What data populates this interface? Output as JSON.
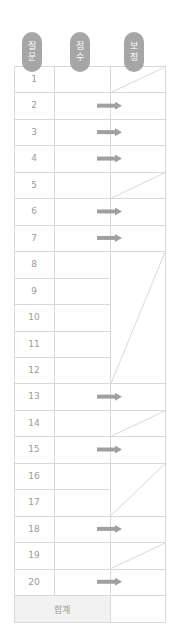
{
  "headers": [
    {
      "label_line1": "질",
      "label_line2": "문",
      "key": "question"
    },
    {
      "label_line1": "점",
      "label_line2": "수",
      "key": "score"
    },
    {
      "label_line1": "보",
      "label_line2": "정",
      "key": "adjustment"
    }
  ],
  "rows": [
    {
      "q": "1",
      "adjust": "blocked"
    },
    {
      "q": "2",
      "adjust": "arrow"
    },
    {
      "q": "3",
      "adjust": "arrow"
    },
    {
      "q": "4",
      "adjust": "arrow"
    },
    {
      "q": "5",
      "adjust": "blocked"
    },
    {
      "q": "6",
      "adjust": "arrow"
    },
    {
      "q": "7",
      "adjust": "arrow"
    },
    {
      "q": "8",
      "adjust": "blocked-merged",
      "merge": "8-12"
    },
    {
      "q": "9",
      "adjust": "blocked-merged",
      "merge": "8-12"
    },
    {
      "q": "10",
      "adjust": "blocked-merged",
      "merge": "8-12"
    },
    {
      "q": "11",
      "adjust": "blocked-merged",
      "merge": "8-12"
    },
    {
      "q": "12",
      "adjust": "blocked-merged",
      "merge": "8-12"
    },
    {
      "q": "13",
      "adjust": "arrow"
    },
    {
      "q": "14",
      "adjust": "blocked"
    },
    {
      "q": "15",
      "adjust": "arrow"
    },
    {
      "q": "16",
      "adjust": "blocked-merged",
      "merge": "16-17"
    },
    {
      "q": "17",
      "adjust": "blocked-merged",
      "merge": "16-17"
    },
    {
      "q": "18",
      "adjust": "arrow"
    },
    {
      "q": "19",
      "adjust": "blocked"
    },
    {
      "q": "20",
      "adjust": "arrow"
    }
  ],
  "total": {
    "label": "합계"
  },
  "colors": {
    "pill": "#a6a6a6",
    "grid": "#d9d9d9",
    "arrow": "#a0a0a0",
    "text": "#9a9a9a",
    "total_bg": "#f2f2f2"
  }
}
